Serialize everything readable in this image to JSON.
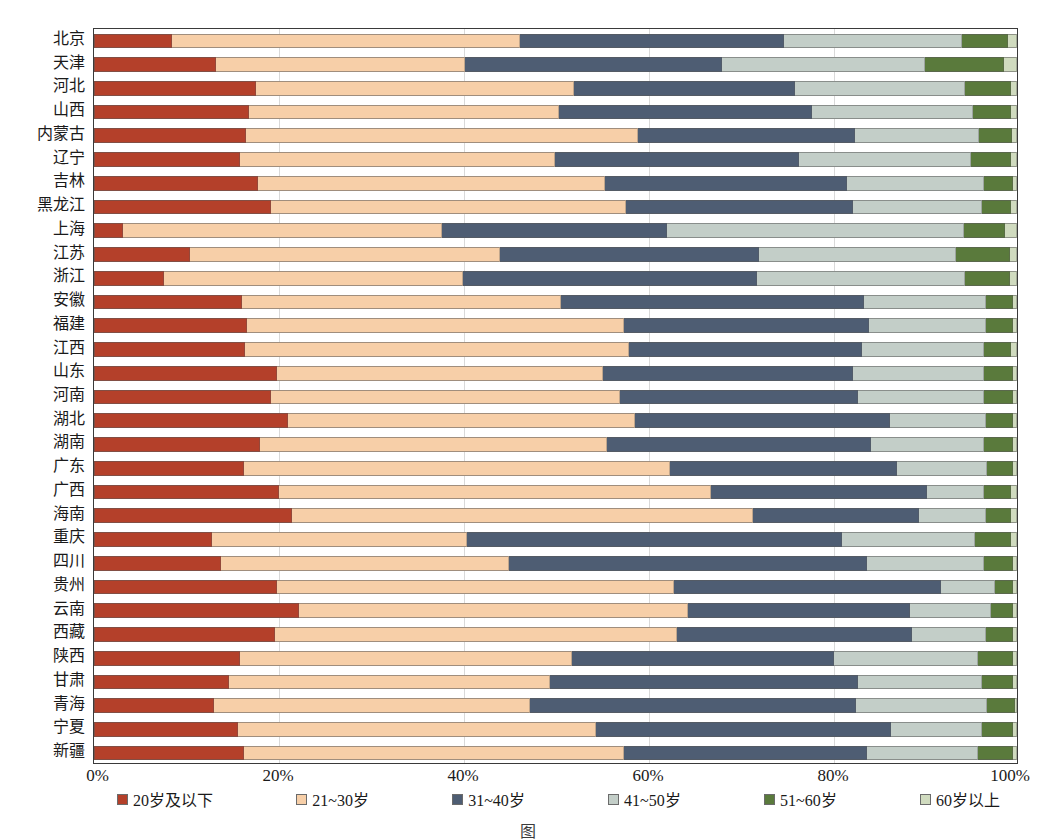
{
  "chart_data": {
    "type": "bar",
    "orientation": "horizontal",
    "stacked": true,
    "normalized": true,
    "title": "",
    "xlabel": "",
    "ylabel": "",
    "xlim": [
      0,
      100
    ],
    "grid": true,
    "legend_position": "bottom",
    "xtick_labels": [
      "0%",
      "20%",
      "40%",
      "60%",
      "80%",
      "100%"
    ],
    "xtick_values": [
      0,
      20,
      40,
      60,
      80,
      100
    ],
    "categories": [
      "北京",
      "天津",
      "河北",
      "山西",
      "内蒙古",
      "辽宁",
      "吉林",
      "黑龙江",
      "上海",
      "江苏",
      "浙江",
      "安徽",
      "福建",
      "江西",
      "山东",
      "河南",
      "湖北",
      "湖南",
      "广东",
      "广西",
      "海南",
      "重庆",
      "四川",
      "贵州",
      "云南",
      "西藏",
      "陕西",
      "甘肃",
      "青海",
      "宁夏",
      "新疆"
    ],
    "series": [
      {
        "name": "20岁及以下",
        "color": "#b4402a",
        "values": [
          8.4,
          13.2,
          17.6,
          16.8,
          16.5,
          15.8,
          17.8,
          19.2,
          3.1,
          10.4,
          7.6,
          16.0,
          16.6,
          16.4,
          19.8,
          19.2,
          21.0,
          18.0,
          16.2,
          20.0,
          21.4,
          12.8,
          13.8,
          19.8,
          22.2,
          19.6,
          15.8,
          14.6,
          13.0,
          15.6,
          16.2
        ]
      },
      {
        "name": "21~30岁",
        "color": "#f7cfa8",
        "values": [
          37.8,
          27.0,
          34.4,
          33.6,
          42.4,
          34.2,
          37.6,
          38.4,
          34.6,
          33.6,
          32.4,
          34.6,
          40.8,
          41.6,
          35.4,
          37.8,
          37.6,
          37.6,
          46.2,
          46.8,
          50.0,
          27.6,
          31.2,
          43.0,
          42.2,
          43.6,
          36.0,
          34.8,
          34.2,
          38.8,
          41.2
        ]
      },
      {
        "name": "31~40岁",
        "color": "#4e5d73",
        "values": [
          28.6,
          27.8,
          24.0,
          27.4,
          23.6,
          26.4,
          26.2,
          24.6,
          24.4,
          28.0,
          31.8,
          32.8,
          26.6,
          25.2,
          27.0,
          25.8,
          27.6,
          28.6,
          24.6,
          23.4,
          18.0,
          40.6,
          38.8,
          29.0,
          24.0,
          25.4,
          28.4,
          33.4,
          35.4,
          32.0,
          26.4
        ]
      },
      {
        "name": "41~50岁",
        "color": "#c3cec8",
        "values": [
          19.2,
          22.0,
          18.4,
          17.4,
          13.4,
          18.6,
          14.8,
          14.0,
          32.2,
          21.4,
          22.6,
          13.2,
          12.6,
          13.2,
          14.2,
          13.6,
          10.4,
          12.2,
          9.8,
          6.2,
          7.2,
          14.4,
          12.6,
          5.8,
          8.8,
          8.0,
          15.6,
          13.4,
          14.2,
          9.8,
          12.0
        ]
      },
      {
        "name": "51~60岁",
        "color": "#5a7a3c",
        "values": [
          5.0,
          8.6,
          5.0,
          4.2,
          3.6,
          4.4,
          3.2,
          3.2,
          4.4,
          5.8,
          4.8,
          3.0,
          3.0,
          3.0,
          3.2,
          3.2,
          3.0,
          3.2,
          2.8,
          3.0,
          2.8,
          4.0,
          3.2,
          2.0,
          2.4,
          3.0,
          3.8,
          3.4,
          3.0,
          3.4,
          3.8
        ]
      },
      {
        "name": "60岁以上",
        "color": "#d0dbbf",
        "values": [
          1.0,
          1.4,
          0.6,
          0.6,
          0.5,
          0.6,
          0.4,
          0.6,
          1.3,
          0.8,
          0.8,
          0.4,
          0.4,
          0.6,
          0.4,
          0.4,
          0.4,
          0.4,
          0.4,
          0.6,
          0.6,
          0.6,
          0.4,
          0.4,
          0.4,
          0.4,
          0.4,
          0.4,
          0.2,
          0.4,
          0.4
        ]
      }
    ]
  },
  "legend": {
    "items": [
      {
        "label": "20岁及以下",
        "color": "#b4402a"
      },
      {
        "label": "21~30岁",
        "color": "#f7cfa8"
      },
      {
        "label": "31~40岁",
        "color": "#4e5d73"
      },
      {
        "label": "41~50岁",
        "color": "#c3cec8"
      },
      {
        "label": "51~60岁",
        "color": "#5a7a3c"
      },
      {
        "label": "60岁以上",
        "color": "#d0dbbf"
      }
    ]
  },
  "caption": {
    "text": "图"
  }
}
